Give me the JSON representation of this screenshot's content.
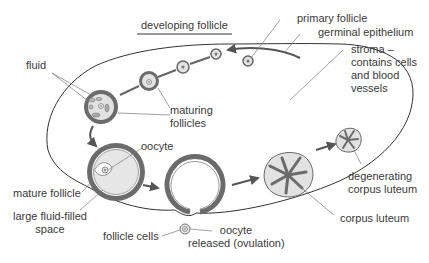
{
  "diagram": {
    "type": "biology-diagram",
    "colors": {
      "outline": "#333333",
      "follicle_wall": "#6b6b6b",
      "fill_light": "#e2e2e2",
      "leader_line": "#7a7a7a",
      "text": "#3a3a3a"
    },
    "labels": {
      "developing_follicle": "developing follicle",
      "primary_follicle": "primary follicle",
      "germinal_epithelium": "germinal epithelium",
      "stroma_line1": "stroma –",
      "stroma_line2": "contains cells",
      "stroma_line3": "and blood",
      "stroma_line4": "vessels",
      "fluid": "fluid",
      "maturing_line1": "maturing",
      "maturing_line2": "follicles",
      "oocyte": "oocyte",
      "mature_follicle": "mature follicle",
      "large_space_line1": "large fluid-filled",
      "large_space_line2": "space",
      "follicle_cells": "follicle cells",
      "released_line1": "oocyte",
      "released_line2": "released (ovulation)",
      "degenerating_line1": "degenerating",
      "degenerating_line2": "corpus luteum",
      "corpus_luteum": "corpus luteum"
    },
    "stages": [
      "primary follicle",
      "developing follicle",
      "maturing follicles",
      "mature follicle",
      "ovulation",
      "corpus luteum",
      "degenerating corpus luteum"
    ]
  }
}
